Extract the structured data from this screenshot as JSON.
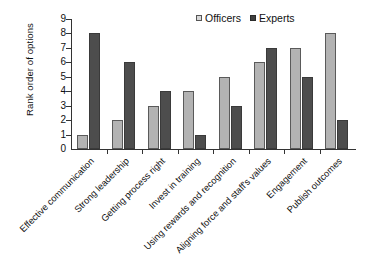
{
  "chart_data": {
    "type": "bar",
    "title": "",
    "xlabel": "",
    "ylabel": "Rank order of options",
    "ylim": [
      0,
      9
    ],
    "yticks": [
      "0",
      "1",
      "2",
      "3",
      "4",
      "5",
      "6",
      "7",
      "8",
      "9"
    ],
    "grid": false,
    "legend_position": "top-right",
    "categories": [
      "Effective communication",
      "Strong leadership",
      "Getting process right",
      "Invest in training",
      "Using rewards and recognition",
      "Aligning force and staff's values",
      "Engagement",
      "Publish outcomes"
    ],
    "series": [
      {
        "name": "Officers",
        "color": "#b3b3b3",
        "values": [
          1,
          2,
          3,
          4,
          5,
          6,
          7,
          8
        ]
      },
      {
        "name": "Experts",
        "color": "#4d4d4d",
        "values": [
          8,
          6,
          4,
          1,
          3,
          7,
          5,
          2
        ]
      }
    ]
  },
  "legend": {
    "items": [
      {
        "label": "Officers",
        "swatch": "officers-swatch-icon"
      },
      {
        "label": "Experts",
        "swatch": "experts-swatch-icon"
      }
    ]
  },
  "axis": {
    "y_title": "Rank order of options"
  }
}
